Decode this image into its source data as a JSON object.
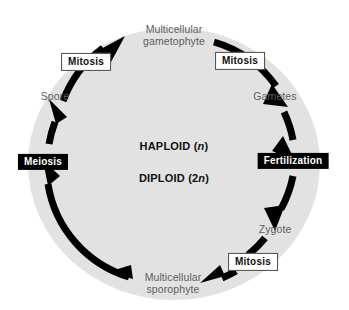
{
  "diagram": {
    "type": "cycle",
    "colors": {
      "page_background": "#ffffff",
      "disc_fill": "#e2e2e2",
      "arrow_black": "#000000",
      "stage_label_text": "#5e5e5e",
      "light_box_fill": "#ffffff",
      "light_box_text": "#111111",
      "dark_box_fill": "#000000",
      "dark_box_text": "#ffffff"
    },
    "center": {
      "haploid": "HAPLOID (",
      "haploid_italic": "n",
      "haploid_close": ")",
      "diploid": "DIPLOID (2",
      "diploid_italic": "n",
      "diploid_close": ")"
    },
    "stages": [
      {
        "id": "gametophyte",
        "line1": "Multicellular",
        "line2": "gametophyte"
      },
      {
        "id": "gametes",
        "line1": "Gametes",
        "line2": ""
      },
      {
        "id": "zygote",
        "line1": "Zygote",
        "line2": ""
      },
      {
        "id": "sporophyte",
        "line1": "Multicellular",
        "line2": "sporophyte"
      },
      {
        "id": "spore",
        "line1": "Spore",
        "line2": ""
      }
    ],
    "processes": [
      {
        "id": "mitosis-spore-to-gametophyte",
        "label": "Mitosis",
        "style": "light"
      },
      {
        "id": "mitosis-gametophyte-to-gametes",
        "label": "Mitosis",
        "style": "light"
      },
      {
        "id": "fertilization",
        "label": "Fertilization",
        "style": "dark"
      },
      {
        "id": "mitosis-zygote-to-sporophyte",
        "label": "Mitosis",
        "style": "light"
      },
      {
        "id": "meiosis",
        "label": "Meiosis",
        "style": "dark"
      }
    ]
  }
}
